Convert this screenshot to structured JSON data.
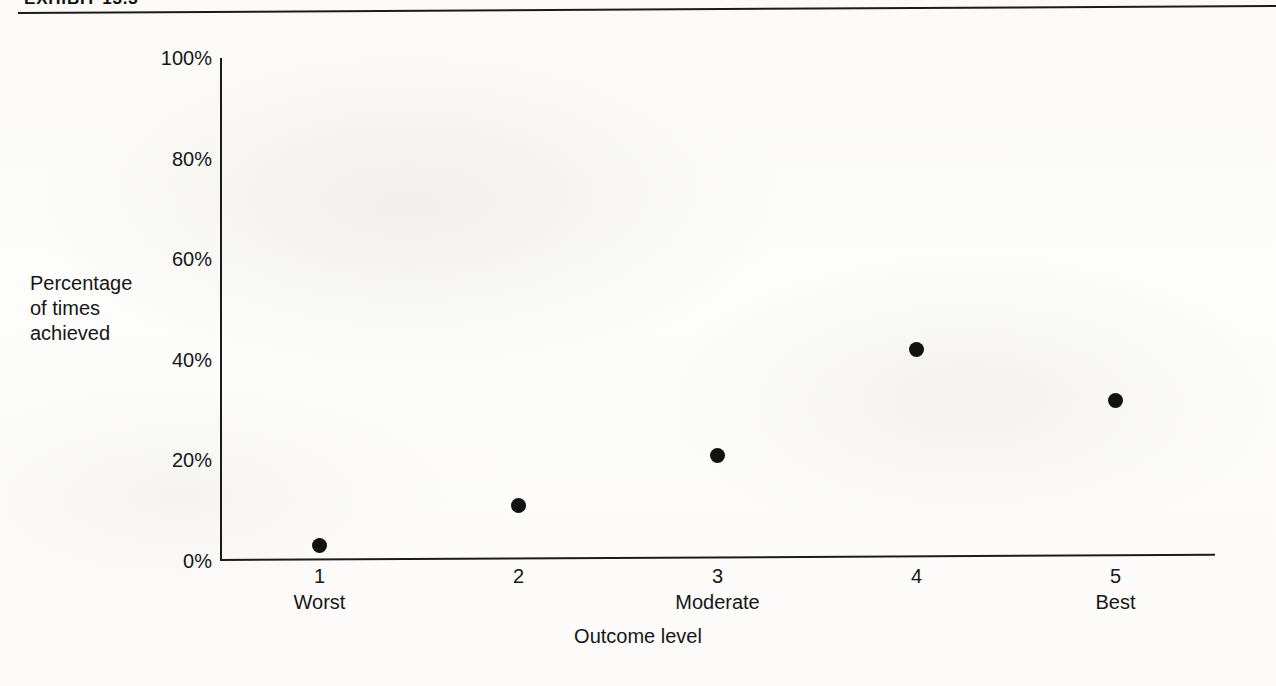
{
  "exhibit": {
    "label": "EXHIBIT 13.3"
  },
  "chart_data": {
    "type": "scatter",
    "title": "",
    "xlabel": "Outcome level",
    "ylabel": "Percentage of times achieved",
    "ylabel_lines": [
      "Percentage",
      "of times",
      "achieved"
    ],
    "x": [
      1,
      2,
      3,
      4,
      5
    ],
    "values": [
      3,
      11,
      21,
      42,
      32
    ],
    "categories": [
      "1",
      "2",
      "3",
      "4",
      "5"
    ],
    "category_anchors": [
      "Worst",
      "",
      "Moderate",
      "",
      "Best"
    ],
    "xlim": [
      0.5,
      5.5
    ],
    "ylim": [
      0,
      100
    ],
    "yticks": [
      "0%",
      "20%",
      "40%",
      "60%",
      "80%",
      "100%"
    ],
    "ytick_values": [
      0,
      20,
      40,
      60,
      80,
      100
    ],
    "grid": false,
    "legend": "none",
    "marker": "filled-circle",
    "marker_color": "#121212"
  }
}
